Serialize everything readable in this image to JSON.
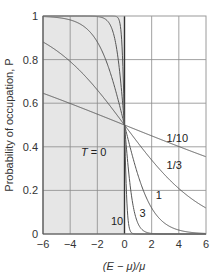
{
  "chart_data": {
    "type": "line",
    "title": "",
    "xlabel": "(E − μ)/μ",
    "ylabel": "Probability of occupation, P",
    "xlim": [
      -6,
      6
    ],
    "ylim": [
      0,
      1
    ],
    "grid": true,
    "x_ticks": [
      -6,
      -4,
      -2,
      0,
      2,
      4,
      6
    ],
    "x_tick_labels": [
      "−6",
      "−4",
      "−2",
      "0",
      "2",
      "4",
      "6"
    ],
    "y_ticks": [
      0,
      0.2,
      0.4,
      0.6,
      0.8,
      1
    ],
    "y_tick_labels": [
      "0",
      "0.2",
      "0.4",
      "0.6",
      "0.8",
      "1"
    ],
    "function": "P = 1 / (exp(k·x) + 1)",
    "shaded_region": {
      "label": "T = 0",
      "x_range": [
        -6,
        0
      ],
      "y_range": [
        0,
        1
      ],
      "color": "#e6e6e6"
    },
    "series": [
      {
        "name": "1/10",
        "k": 10,
        "label": "1/10"
      },
      {
        "name": "1/3",
        "k": 3,
        "label": "1/3"
      },
      {
        "name": "1",
        "k": 1,
        "label": "1"
      },
      {
        "name": "3",
        "k": 0.3333,
        "label": "3"
      },
      {
        "name": "10",
        "k": 0.1,
        "label": "10"
      }
    ],
    "series_note": "Curves labelled by parameter; flattest curve labelled 1/10, steepest labelled 10",
    "curves": [
      {
        "label": "1/10",
        "k": 0.1
      },
      {
        "label": "1/3",
        "k": 0.3333
      },
      {
        "label": "1",
        "k": 1
      },
      {
        "label": "3",
        "k": 3
      },
      {
        "label": "10",
        "k": 10
      }
    ],
    "annotations": [
      {
        "text": "T = 0",
        "x": -3.2,
        "y": 0.36
      },
      {
        "text": "1/10",
        "x": 3.1,
        "y": 0.42
      },
      {
        "text": "1/3",
        "x": 3.1,
        "y": 0.3
      },
      {
        "text": "1",
        "x": 2.3,
        "y": 0.16
      },
      {
        "text": "3",
        "x": 1.1,
        "y": 0.08
      },
      {
        "text": "10",
        "x": -1.0,
        "y": 0.04
      }
    ],
    "colors": {
      "grid": "#8a8a8a",
      "curve": "#555555",
      "shade": "#e6e6e6",
      "axis": "#555555"
    }
  }
}
